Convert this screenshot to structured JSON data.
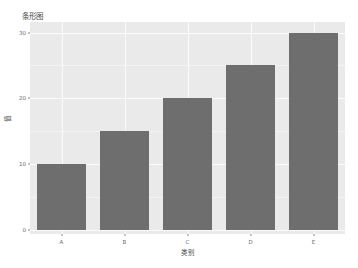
{
  "chart_data": {
    "type": "bar",
    "title": "条形图",
    "xlabel": "类别",
    "ylabel": "值",
    "categories": [
      "A",
      "B",
      "C",
      "D",
      "E"
    ],
    "values": [
      10,
      15,
      20,
      25,
      30
    ],
    "ylim": [
      0,
      31
    ],
    "yticks": [
      "0",
      "10",
      "20",
      "30"
    ],
    "ytick_values": [
      0,
      10,
      20,
      30
    ],
    "grid": true,
    "legend": "none",
    "bar_color": "#6e6e6e",
    "panel_background": "#eaeaea",
    "gridline_color": "#fbfbfb",
    "figure_background": "#ffffff",
    "axis_text_color": "#6b6b6b"
  }
}
